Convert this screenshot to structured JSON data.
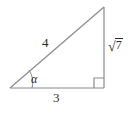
{
  "figure": {
    "name": "right-triangle-diagram",
    "width": 131,
    "height": 114,
    "background_color": "#ffffff",
    "line_color": "#8a8a8a",
    "text_color": "#2b2b2b",
    "geometry": {
      "vertices": {
        "left": {
          "x": 10,
          "y": 88
        },
        "bottom_right": {
          "x": 104,
          "y": 88
        },
        "top_right": {
          "x": 104,
          "y": 7
        }
      },
      "right_angle_marker": {
        "at": "bottom_right",
        "size": 10
      },
      "angle_arc": {
        "at": "left",
        "radius": 22
      }
    },
    "labels": {
      "hypotenuse": "4",
      "base": "3",
      "vertical_radical_sign": "√",
      "vertical_radicand": "7",
      "vertical_full": "√7",
      "angle": "α"
    }
  }
}
